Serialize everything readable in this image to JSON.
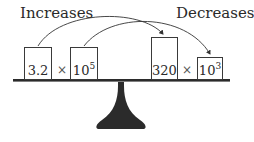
{
  "labels": {
    "left": "Increases",
    "right": "Decreases"
  },
  "left_side": {
    "coefficient": "3.2",
    "times": "×",
    "base": "10",
    "exponent": "5"
  },
  "right_side": {
    "coefficient": "320",
    "times": "×",
    "base": "10",
    "exponent": "3"
  },
  "colors": {
    "ink": "#2a2a2a",
    "fulcrum": "#2b2b2b",
    "background": "#ffffff"
  }
}
